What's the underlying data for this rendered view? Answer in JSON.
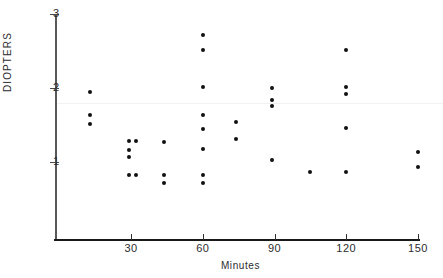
{
  "chart_data": {
    "type": "scatter",
    "title": "",
    "xlabel": "Minutes",
    "ylabel": "DIOPTERS",
    "xlim": [
      0,
      152
    ],
    "ylim": [
      0,
      3
    ],
    "grid": false,
    "legend": null,
    "xticks": [
      30,
      60,
      90,
      120,
      150
    ],
    "yticks": [
      1,
      2,
      3
    ],
    "xtick_labels": [
      "30",
      "60",
      "90",
      "120",
      "150"
    ],
    "ytick_labels": [
      "1",
      "2",
      "3"
    ],
    "points": [
      {
        "x": 13,
        "y": 1.94
      },
      {
        "x": 13,
        "y": 1.63
      },
      {
        "x": 13,
        "y": 1.51
      },
      {
        "x": 29,
        "y": 1.29
      },
      {
        "x": 32,
        "y": 1.29
      },
      {
        "x": 29,
        "y": 1.16
      },
      {
        "x": 29,
        "y": 1.07
      },
      {
        "x": 29,
        "y": 0.82
      },
      {
        "x": 32,
        "y": 0.82
      },
      {
        "x": 44,
        "y": 1.27
      },
      {
        "x": 44,
        "y": 0.82
      },
      {
        "x": 44,
        "y": 0.71
      },
      {
        "x": 60,
        "y": 2.71
      },
      {
        "x": 60,
        "y": 2.52
      },
      {
        "x": 60,
        "y": 2.01
      },
      {
        "x": 60,
        "y": 1.63
      },
      {
        "x": 60,
        "y": 1.44
      },
      {
        "x": 60,
        "y": 1.17
      },
      {
        "x": 60,
        "y": 0.82
      },
      {
        "x": 60,
        "y": 0.71
      },
      {
        "x": 74,
        "y": 1.54
      },
      {
        "x": 74,
        "y": 1.31
      },
      {
        "x": 89,
        "y": 2.0
      },
      {
        "x": 89,
        "y": 1.84
      },
      {
        "x": 89,
        "y": 1.76
      },
      {
        "x": 89,
        "y": 1.03
      },
      {
        "x": 105,
        "y": 0.87
      },
      {
        "x": 120,
        "y": 2.52
      },
      {
        "x": 120,
        "y": 2.01
      },
      {
        "x": 120,
        "y": 1.92
      },
      {
        "x": 120,
        "y": 1.46
      },
      {
        "x": 120,
        "y": 0.87
      },
      {
        "x": 150,
        "y": 1.13
      },
      {
        "x": 150,
        "y": 0.93
      }
    ],
    "colors": {
      "marker": "#111113",
      "axis": "#19191a",
      "text": "#2c2c2e"
    }
  },
  "axes": {
    "y_title": "DIOPTERS",
    "x_title": "Minutes"
  }
}
